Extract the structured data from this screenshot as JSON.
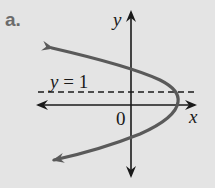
{
  "figure": {
    "part_label": "a.",
    "axis_labels": {
      "x": "x",
      "y": "y",
      "origin": "0"
    },
    "asymptote_label": {
      "var": "y",
      "eq": " = 1"
    },
    "colors": {
      "background": "#e4e4e4",
      "axes": "#1a1a1a",
      "curve": "#5a5a5a",
      "dashed_line": "#1a1a1a",
      "part_label": "#6b6b6b"
    },
    "curve": {
      "type": "parabola",
      "opens": "left",
      "vertex_approx": "right of origin, near x-axis",
      "arrows": [
        "upper-left",
        "lower-left"
      ]
    },
    "reference_line": {
      "equation": "y = 1",
      "style": "dashed"
    }
  }
}
